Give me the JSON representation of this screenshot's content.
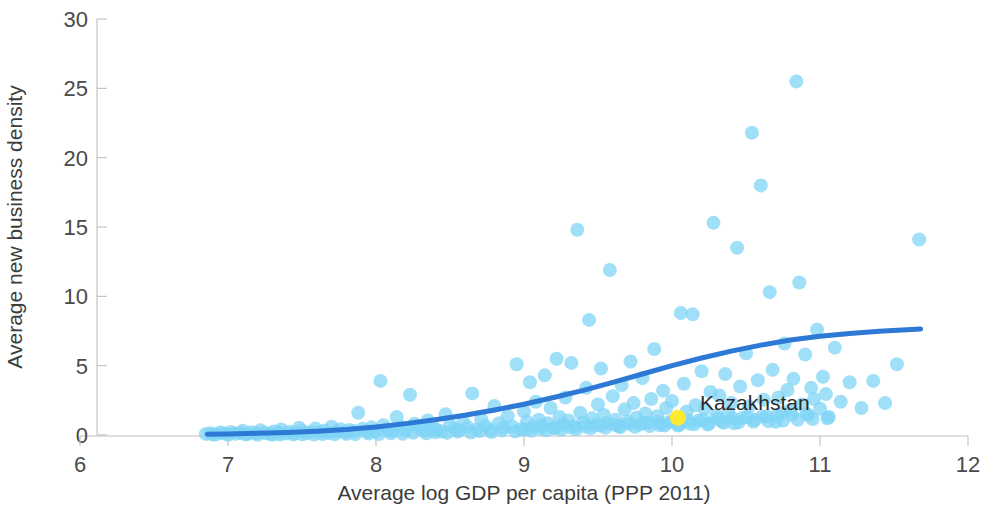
{
  "chart_data": {
    "type": "scatter",
    "title": "",
    "xlabel": "Average log GDP per capita (PPP 2011)",
    "ylabel": "Average new business density",
    "xlim": [
      6,
      12
    ],
    "ylim": [
      0,
      30
    ],
    "xticks": [
      "6",
      "7",
      "8",
      "9",
      "10",
      "11",
      "12"
    ],
    "yticks": [
      "0",
      "5",
      "10",
      "15",
      "20",
      "25",
      "30"
    ],
    "grid": false,
    "legend": "none",
    "point_color": "#7FD4F5",
    "point_opacity": 0.75,
    "point_radius": 7,
    "highlight_color": "#FFE92E",
    "trend_color": "#2E79D6",
    "trend_width": 5,
    "axis_color": "#bfbfbf",
    "annotations": [
      {
        "label": "Kazakhstan",
        "x": 10.04,
        "y": 1.25,
        "color": "#FFE92E",
        "label_dx": 22,
        "label_dy": -8
      }
    ],
    "series": [
      {
        "name": "Countries",
        "points": [
          [
            6.85,
            0.08
          ],
          [
            6.88,
            0.12
          ],
          [
            6.92,
            0.05
          ],
          [
            6.95,
            0.18
          ],
          [
            6.98,
            0.1
          ],
          [
            7.02,
            0.22
          ],
          [
            7.05,
            0.09
          ],
          [
            7.08,
            0.15
          ],
          [
            7.1,
            0.3
          ],
          [
            7.13,
            0.07
          ],
          [
            7.16,
            0.2
          ],
          [
            7.19,
            0.12
          ],
          [
            7.22,
            0.35
          ],
          [
            7.25,
            0.14
          ],
          [
            7.28,
            0.09
          ],
          [
            7.31,
            0.26
          ],
          [
            7.34,
            0.18
          ],
          [
            7.36,
            0.4
          ],
          [
            7.39,
            0.11
          ],
          [
            7.42,
            0.23
          ],
          [
            7.45,
            0.16
          ],
          [
            7.48,
            0.52
          ],
          [
            7.5,
            0.3
          ],
          [
            7.53,
            0.13
          ],
          [
            7.56,
            0.21
          ],
          [
            7.59,
            0.46
          ],
          [
            7.62,
            0.19
          ],
          [
            7.65,
            0.33
          ],
          [
            7.68,
            0.15
          ],
          [
            7.7,
            0.6
          ],
          [
            7.73,
            0.25
          ],
          [
            7.76,
            0.42
          ],
          [
            7.79,
            0.18
          ],
          [
            7.82,
            0.36
          ],
          [
            7.85,
            0.28
          ],
          [
            7.88,
            1.6
          ],
          [
            7.91,
            0.45
          ],
          [
            7.94,
            0.22
          ],
          [
            7.97,
            0.55
          ],
          [
            8.0,
            0.31
          ],
          [
            8.03,
            3.9
          ],
          [
            8.05,
            0.7
          ],
          [
            8.08,
            0.4
          ],
          [
            8.11,
            0.27
          ],
          [
            8.14,
            1.3
          ],
          [
            8.17,
            0.58
          ],
          [
            8.2,
            0.35
          ],
          [
            8.23,
            2.9
          ],
          [
            8.26,
            0.82
          ],
          [
            8.29,
            0.48
          ],
          [
            8.32,
            0.3
          ],
          [
            8.35,
            1.05
          ],
          [
            8.38,
            0.62
          ],
          [
            8.41,
            0.38
          ],
          [
            8.44,
            0.25
          ],
          [
            8.47,
            1.5
          ],
          [
            8.5,
            0.7
          ],
          [
            8.53,
            0.44
          ],
          [
            8.56,
            0.33
          ],
          [
            8.59,
            0.95
          ],
          [
            8.62,
            0.55
          ],
          [
            8.65,
            3.0
          ],
          [
            8.68,
            0.4
          ],
          [
            8.71,
            1.15
          ],
          [
            8.74,
            0.66
          ],
          [
            8.77,
            0.36
          ],
          [
            8.8,
            2.1
          ],
          [
            8.83,
            0.85
          ],
          [
            8.86,
            0.5
          ],
          [
            8.89,
            1.35
          ],
          [
            8.92,
            0.62
          ],
          [
            8.95,
            5.1
          ],
          [
            8.98,
            0.42
          ],
          [
            9.0,
            1.7
          ],
          [
            9.02,
            0.95
          ],
          [
            9.04,
            3.8
          ],
          [
            9.06,
            0.58
          ],
          [
            9.08,
            2.4
          ],
          [
            9.1,
            1.1
          ],
          [
            9.12,
            0.7
          ],
          [
            9.14,
            4.3
          ],
          [
            9.16,
            0.85
          ],
          [
            9.18,
            1.95
          ],
          [
            9.2,
            0.52
          ],
          [
            9.22,
            5.5
          ],
          [
            9.24,
            1.3
          ],
          [
            9.26,
            0.78
          ],
          [
            9.28,
            2.7
          ],
          [
            9.3,
            1.05
          ],
          [
            9.32,
            5.2
          ],
          [
            9.34,
            0.62
          ],
          [
            9.36,
            14.8
          ],
          [
            9.38,
            1.6
          ],
          [
            9.4,
            0.9
          ],
          [
            9.42,
            3.4
          ],
          [
            9.44,
            8.3
          ],
          [
            9.46,
            1.2
          ],
          [
            9.48,
            0.7
          ],
          [
            9.5,
            2.2
          ],
          [
            9.52,
            4.8
          ],
          [
            9.54,
            1.45
          ],
          [
            9.56,
            0.85
          ],
          [
            9.58,
            11.9
          ],
          [
            9.6,
            2.8
          ],
          [
            9.62,
            1.1
          ],
          [
            9.64,
            0.65
          ],
          [
            9.66,
            3.6
          ],
          [
            9.68,
            1.85
          ],
          [
            9.7,
            0.95
          ],
          [
            9.72,
            5.3
          ],
          [
            9.74,
            2.3
          ],
          [
            9.76,
            1.25
          ],
          [
            9.78,
            0.75
          ],
          [
            9.8,
            4.1
          ],
          [
            9.82,
            1.55
          ],
          [
            9.84,
            0.88
          ],
          [
            9.86,
            2.6
          ],
          [
            9.88,
            6.2
          ],
          [
            9.9,
            1.35
          ],
          [
            9.92,
            0.7
          ],
          [
            9.94,
            3.2
          ],
          [
            9.96,
            1.95
          ],
          [
            9.98,
            0.92
          ],
          [
            10.0,
            2.45
          ],
          [
            10.02,
            1.15
          ],
          [
            10.04,
            0.68
          ],
          [
            10.06,
            8.8
          ],
          [
            10.08,
            3.7
          ],
          [
            10.1,
            1.7
          ],
          [
            10.12,
            0.82
          ],
          [
            10.14,
            8.7
          ],
          [
            10.16,
            2.15
          ],
          [
            10.18,
            1.05
          ],
          [
            10.2,
            4.6
          ],
          [
            10.22,
            1.9
          ],
          [
            10.24,
            0.75
          ],
          [
            10.26,
            3.1
          ],
          [
            10.28,
            15.3
          ],
          [
            10.3,
            1.4
          ],
          [
            10.32,
            2.85
          ],
          [
            10.34,
            0.95
          ],
          [
            10.36,
            4.4
          ],
          [
            10.38,
            1.6
          ],
          [
            10.4,
            2.3
          ],
          [
            10.42,
            0.85
          ],
          [
            10.44,
            13.5
          ],
          [
            10.46,
            3.5
          ],
          [
            10.48,
            1.25
          ],
          [
            10.5,
            5.9
          ],
          [
            10.52,
            2.05
          ],
          [
            10.54,
            21.8
          ],
          [
            10.56,
            1.1
          ],
          [
            10.58,
            3.95
          ],
          [
            10.6,
            18.0
          ],
          [
            10.62,
            2.55
          ],
          [
            10.64,
            1.35
          ],
          [
            10.66,
            10.3
          ],
          [
            10.68,
            4.7
          ],
          [
            10.7,
            0.95
          ],
          [
            10.72,
            2.7
          ],
          [
            10.74,
            1.55
          ],
          [
            10.76,
            6.6
          ],
          [
            10.78,
            3.25
          ],
          [
            10.8,
            1.8
          ],
          [
            10.82,
            4.05
          ],
          [
            10.84,
            25.5
          ],
          [
            10.86,
            11.0
          ],
          [
            10.88,
            2.2
          ],
          [
            10.9,
            5.8
          ],
          [
            10.92,
            1.45
          ],
          [
            10.94,
            3.4
          ],
          [
            10.96,
            2.6
          ],
          [
            10.98,
            7.6
          ],
          [
            11.0,
            1.9
          ],
          [
            11.02,
            4.2
          ],
          [
            11.04,
            2.95
          ],
          [
            11.06,
            1.3
          ],
          [
            11.1,
            6.3
          ],
          [
            11.14,
            2.4
          ],
          [
            11.2,
            3.8
          ],
          [
            11.28,
            1.95
          ],
          [
            11.36,
            3.9
          ],
          [
            11.44,
            2.3
          ],
          [
            11.52,
            5.1
          ],
          [
            11.67,
            14.1
          ],
          [
            7.3,
            0.02
          ],
          [
            7.44,
            0.03
          ],
          [
            7.58,
            0.04
          ],
          [
            7.72,
            0.05
          ],
          [
            7.86,
            0.06
          ],
          [
            8.02,
            0.07
          ],
          [
            8.18,
            0.09
          ],
          [
            8.34,
            0.12
          ],
          [
            8.48,
            0.15
          ],
          [
            8.64,
            0.18
          ],
          [
            8.78,
            0.22
          ],
          [
            8.94,
            0.26
          ],
          [
            9.05,
            0.3
          ],
          [
            9.15,
            0.34
          ],
          [
            9.25,
            0.38
          ],
          [
            9.35,
            0.42
          ],
          [
            9.45,
            0.48
          ],
          [
            9.55,
            0.52
          ],
          [
            9.65,
            0.56
          ],
          [
            9.75,
            0.6
          ],
          [
            9.85,
            0.64
          ],
          [
            9.95,
            0.68
          ],
          [
            10.05,
            0.72
          ],
          [
            10.15,
            0.78
          ],
          [
            10.25,
            0.82
          ],
          [
            10.35,
            0.88
          ],
          [
            10.45,
            0.92
          ],
          [
            10.55,
            0.96
          ],
          [
            10.65,
            1.0
          ],
          [
            10.75,
            1.05
          ],
          [
            10.85,
            1.1
          ],
          [
            10.95,
            1.15
          ],
          [
            11.05,
            1.2
          ],
          [
            6.9,
            0.01
          ],
          [
            7.0,
            0.02
          ],
          [
            7.12,
            0.03
          ],
          [
            7.2,
            0.02
          ],
          [
            7.35,
            0.04
          ],
          [
            7.5,
            0.05
          ],
          [
            7.64,
            0.06
          ],
          [
            7.8,
            0.08
          ],
          [
            7.95,
            0.1
          ],
          [
            8.1,
            0.13
          ],
          [
            8.25,
            0.16
          ],
          [
            8.4,
            0.2
          ],
          [
            8.55,
            0.24
          ],
          [
            8.7,
            0.28
          ],
          [
            8.85,
            0.33
          ],
          [
            9.01,
            0.38
          ],
          [
            9.11,
            0.44
          ],
          [
            9.21,
            0.5
          ],
          [
            9.31,
            0.56
          ],
          [
            9.41,
            0.62
          ],
          [
            9.51,
            0.68
          ],
          [
            9.61,
            0.74
          ],
          [
            9.71,
            0.8
          ],
          [
            9.81,
            0.86
          ],
          [
            9.91,
            0.92
          ],
          [
            10.01,
            0.98
          ],
          [
            10.11,
            1.04
          ],
          [
            10.21,
            1.1
          ],
          [
            10.31,
            1.16
          ],
          [
            10.41,
            1.22
          ],
          [
            10.51,
            1.28
          ],
          [
            10.61,
            1.34
          ],
          [
            10.71,
            1.4
          ],
          [
            10.81,
            1.46
          ],
          [
            10.91,
            1.52
          ]
        ]
      }
    ],
    "trend": {
      "name": "Fitted curve",
      "points": [
        [
          6.86,
          0.06
        ],
        [
          7.0,
          0.08
        ],
        [
          7.2,
          0.12
        ],
        [
          7.4,
          0.18
        ],
        [
          7.6,
          0.27
        ],
        [
          7.8,
          0.4
        ],
        [
          8.0,
          0.58
        ],
        [
          8.2,
          0.82
        ],
        [
          8.4,
          1.1
        ],
        [
          8.6,
          1.42
        ],
        [
          8.8,
          1.8
        ],
        [
          9.0,
          2.22
        ],
        [
          9.2,
          2.7
        ],
        [
          9.4,
          3.22
        ],
        [
          9.6,
          3.8
        ],
        [
          9.8,
          4.4
        ],
        [
          10.0,
          5.0
        ],
        [
          10.2,
          5.55
        ],
        [
          10.4,
          6.05
        ],
        [
          10.6,
          6.48
        ],
        [
          10.8,
          6.85
        ],
        [
          11.0,
          7.12
        ],
        [
          11.2,
          7.32
        ],
        [
          11.4,
          7.48
        ],
        [
          11.68,
          7.65
        ]
      ]
    }
  }
}
